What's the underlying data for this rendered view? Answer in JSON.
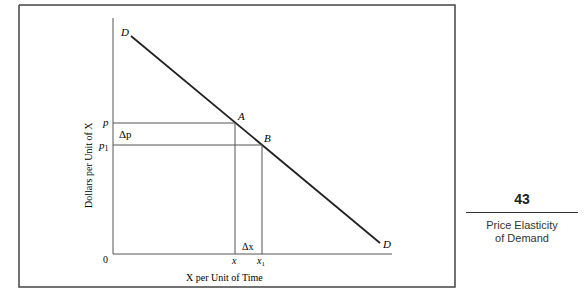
{
  "figure": {
    "curve_label_start": "D",
    "curve_label_end": "D",
    "point_a": "A",
    "point_b": "B",
    "y_axis_title": "Dollars per Unit of X",
    "x_axis_title": "X per Unit of Time",
    "origin": "0",
    "price_label": "p",
    "price1_label": "p",
    "price1_sub": "1",
    "delta_p": "Δp",
    "qty_label": "x",
    "qty1_label": "x",
    "qty1_sub": "1",
    "delta_x": "Δx"
  },
  "sidebar": {
    "page_number": "43",
    "section_title_line1": "Price Elasticity",
    "section_title_line2": "of Demand"
  }
}
